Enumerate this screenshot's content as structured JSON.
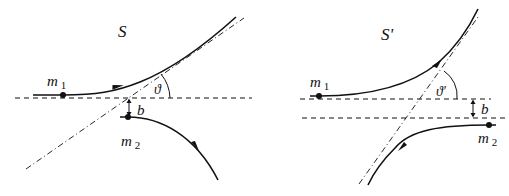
{
  "left_panel": {
    "frame_label": "S",
    "mass1_label": "m",
    "mass1_sub": "1",
    "mass2_label": "m",
    "mass2_sub": "2",
    "angle_label": "ϑ",
    "impact_label": "b"
  },
  "right_panel": {
    "frame_label": "S'",
    "mass1_label": "m",
    "mass1_sub": "1",
    "mass2_label": "m",
    "mass2_sub": "2",
    "angle_label": "ϑ'",
    "impact_label": "b"
  },
  "colors": {
    "stroke": "#111111",
    "background": "#ffffff"
  }
}
